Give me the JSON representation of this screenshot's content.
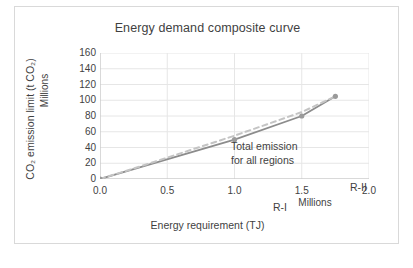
{
  "figure": {
    "border_color": "#d9d9d9",
    "background": "#ffffff"
  },
  "chart_data": {
    "type": "line",
    "title": "Energy demand composite curve",
    "xlabel": "Energy requirement (TJ)",
    "ylabel": "CO₂ emission limit  (t CO₂)",
    "x_unit_label": "Millions",
    "y_unit_label": "Millions",
    "xlim": [
      0.0,
      2.0
    ],
    "ylim": [
      0,
      160
    ],
    "xticks": [
      "0.0",
      "0.5",
      "1.0",
      "1.5",
      "2.0"
    ],
    "xtick_values": [
      0.0,
      0.5,
      1.0,
      1.5,
      2.0
    ],
    "yticks": [
      "0",
      "20",
      "40",
      "60",
      "80",
      "100",
      "120",
      "140",
      "160"
    ],
    "ytick_values": [
      0,
      20,
      40,
      60,
      80,
      100,
      120,
      140,
      160
    ],
    "grid": "both",
    "grid_color": "#e6e6e6",
    "legend": "none",
    "series": [
      {
        "name": "Composite curve",
        "style": "solid",
        "color": "#8c8c8c",
        "marker": "circle",
        "marker_color": "#9a9a9a",
        "x": [
          0.0,
          1.0,
          1.5,
          1.75
        ],
        "values": [
          0,
          50,
          80,
          105
        ]
      },
      {
        "name": "Total emission for all regions",
        "style": "dashed",
        "color": "#c4c4c4",
        "marker": "none",
        "x": [
          0.0,
          0.3,
          1.0,
          1.5,
          1.75
        ],
        "values": [
          0,
          16,
          55,
          85,
          105
        ]
      }
    ],
    "annotations": [
      {
        "id": "total-emission",
        "line1": "Total emission",
        "line2": "for all regions",
        "x": 0.38,
        "y": 108
      },
      {
        "id": "region-1",
        "text": "R-I",
        "x": 0.7,
        "y": 28
      },
      {
        "id": "region-2",
        "text": "R-II",
        "x": 1.27,
        "y": 54
      },
      {
        "id": "region-3",
        "text": "R-III",
        "x": 1.78,
        "y": 78
      }
    ]
  }
}
